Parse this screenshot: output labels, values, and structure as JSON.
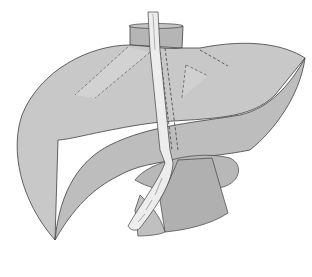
{
  "illustration": {
    "subject": "liver with transhepatic drainage tube",
    "colors": {
      "background": "#ffffff",
      "liver_fill": "#c8c8c8",
      "liver_underside": "#bdbdbd",
      "vessel_fill": "#b0b0b0",
      "tube_fill": "#ededed",
      "outline": "#404040",
      "duct_highlight": "#dcdcdc"
    }
  }
}
